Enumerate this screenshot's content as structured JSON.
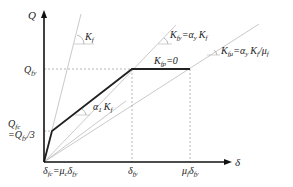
{
  "diagram": {
    "type": "force-displacement backbone curve",
    "axes": {
      "y_label": "Q",
      "x_label": "δ"
    },
    "y_ticks": {
      "q_fy": "Q",
      "q_fy_sub": "fy",
      "q_fc_line1": "Q",
      "q_fc_line1_sub": "fc",
      "q_fc_line2": "=Q",
      "q_fc_line2_sub": "fy",
      "q_fc_line2_tail": "/3"
    },
    "x_ticks": {
      "delta_fc": "δ",
      "delta_fc_sub": "fc",
      "delta_fc_eq": "=μ",
      "delta_fc_eq_sub": "c",
      "delta_fc_tail": "δ",
      "delta_fc_tail_sub": "fy",
      "delta_fy": "δ",
      "delta_fy_sub": "fy",
      "mu_delta_fy": "μ",
      "mu_delta_fy_sub": "f",
      "mu_delta_fy_tail": "δ",
      "mu_delta_fy_tail_sub": "fy"
    },
    "annotations": {
      "kf": "K",
      "kf_sub": "f",
      "alpha1": "α",
      "alpha1_sub": "1",
      "alpha1_k": "K",
      "alpha1_k_sub": "f",
      "kfy": "K",
      "kfy_sub": "fy",
      "kfy_eq": "=α",
      "kfy_eq_sub": "y",
      "kfy_k": "K",
      "kfy_k_sub": "f",
      "kfp": "K",
      "kfp_sub": "fp",
      "kfp_eq": "=0",
      "kfmu": "K",
      "kfmu_sub": "fμ",
      "kfmu_eq": "=α",
      "kfmu_eq_sub": "y",
      "kfmu_k": "K",
      "kfmu_k_sub": "f",
      "kfmu_div": "/μ",
      "kfmu_div_sub": "f"
    },
    "colors": {
      "curve": "#222222",
      "axis": "#111111",
      "guide": "#bbbbbb",
      "dashed": "#999999"
    }
  }
}
